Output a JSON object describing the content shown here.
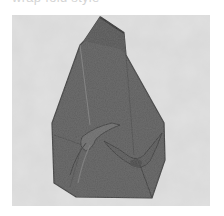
{
  "caption": {
    "text": "wrap fold style",
    "visible": "partially clipped at top edge"
  },
  "photo": {
    "subject": "folded dark grey cloth wrap with two knots",
    "background": "light grey marble surface",
    "colors": {
      "surface": "#d6d6d6",
      "surface_speckle": "#bdbdbd",
      "cloth": "#5e5e5e",
      "cloth_shadow": "#3e3e3e",
      "cloth_highlight": "#7a7a7a"
    }
  }
}
